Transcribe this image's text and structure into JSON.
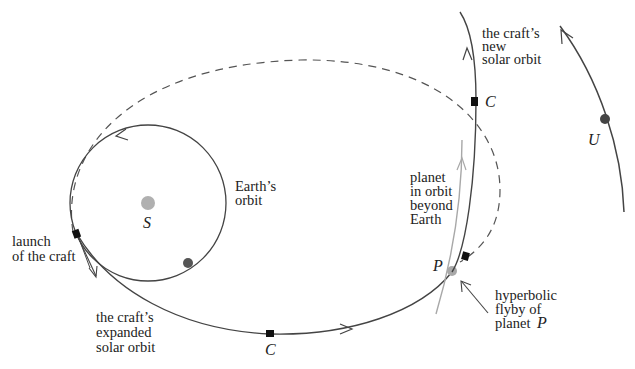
{
  "diagram": {
    "colors": {
      "background": "#ffffff",
      "orbit_line": "#444444",
      "dashed_orbit": "#555555",
      "planet_orbit": "#a8a8a8",
      "sun": "#b0b0b0",
      "earth": "#555555",
      "planet_p": "#a8a8a8",
      "planet_u": "#444444",
      "craft_marker": "#111111",
      "text": "#222222"
    },
    "labels": {
      "sun": "S",
      "earth_orbit_line1": "Earth’s",
      "earth_orbit_line2": "orbit",
      "launch_line1": "launch",
      "launch_line2": "of the craft",
      "expanded_line1": "the craft’s",
      "expanded_line2": "expanded",
      "expanded_line3": "solar orbit",
      "craft_bottom": "C",
      "craft_top": "C",
      "planet_line1": "planet",
      "planet_line2": "in orbit",
      "planet_line3": "beyond",
      "planet_line4": "Earth",
      "planet_p": "P",
      "flyby_line1": "hyperbolic",
      "flyby_line2": "flyby of",
      "flyby_line3": "planet",
      "flyby_p": "P",
      "new_orbit_line1": "the craft’s",
      "new_orbit_line2": "new",
      "new_orbit_line3": "solar orbit",
      "planet_u": "U"
    }
  }
}
